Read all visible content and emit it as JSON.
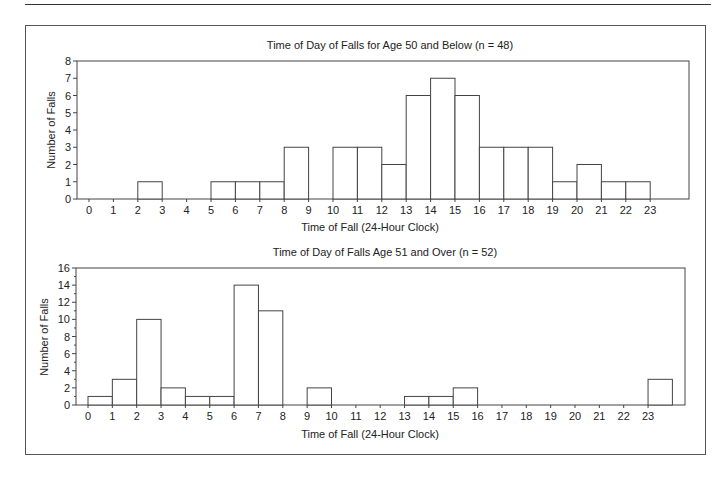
{
  "chart_data": [
    {
      "type": "bar",
      "title": "Time of Day of Falls for Age 50 and Below (n = 48)",
      "xlabel": "Time of Fall (24-Hour Clock)",
      "ylabel": "Number of Falls",
      "ylim": [
        0,
        8
      ],
      "yticks": [
        0,
        1,
        2,
        3,
        4,
        5,
        6,
        7,
        8
      ],
      "categories": [
        "0",
        "1",
        "2",
        "3",
        "4",
        "5",
        "6",
        "7",
        "8",
        "9",
        "10",
        "11",
        "12",
        "13",
        "14",
        "15",
        "16",
        "17",
        "18",
        "19",
        "20",
        "21",
        "22",
        "23"
      ],
      "values": [
        0,
        0,
        1,
        0,
        0,
        1,
        1,
        1,
        3,
        0,
        3,
        3,
        2,
        6,
        7,
        6,
        3,
        3,
        3,
        1,
        2,
        1,
        1,
        0
      ],
      "grid": false,
      "legend": null
    },
    {
      "type": "bar",
      "title": "Time of Day of Falls Age 51 and Over (n = 52)",
      "xlabel": "Time of Fall (24-Hour Clock)",
      "ylabel": "Number of Falls",
      "ylim": [
        0,
        16
      ],
      "yticks": [
        0,
        2,
        4,
        6,
        8,
        10,
        12,
        14,
        16
      ],
      "categories": [
        "0",
        "1",
        "2",
        "3",
        "4",
        "5",
        "6",
        "7",
        "8",
        "9",
        "10",
        "11",
        "12",
        "13",
        "14",
        "15",
        "16",
        "17",
        "18",
        "19",
        "20",
        "21",
        "22",
        "23"
      ],
      "values": [
        1,
        3,
        10,
        2,
        1,
        1,
        14,
        11,
        0,
        2,
        0,
        0,
        0,
        1,
        1,
        2,
        0,
        0,
        0,
        0,
        0,
        0,
        0,
        3
      ],
      "grid": false,
      "legend": null
    }
  ],
  "charts": {
    "top": {
      "title": "Time of Day of Falls for Age 50 and Below (n = 48)",
      "xlabel": "Time of Fall (24-Hour Clock)",
      "ylabel": "Number of Falls"
    },
    "bottom": {
      "title": "Time of Day of Falls Age 51 and Over (n = 52)",
      "xlabel": "Time of Fall (24-Hour Clock)",
      "ylabel": "Number of Falls"
    }
  },
  "colors": {
    "bar_fill": "#ffffff",
    "bar_stroke": "#444444",
    "axis": "#444444",
    "text": "#222222"
  }
}
